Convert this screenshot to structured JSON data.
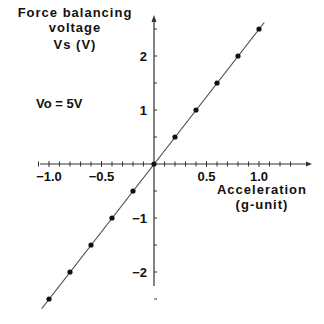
{
  "chart_data": {
    "type": "line",
    "title": "",
    "ylabel": [
      "Force balancing",
      "voltage",
      "Vs (V)"
    ],
    "xlabel": [
      "Acceleration",
      "(g-unit)"
    ],
    "annotation": "Vo = 5V",
    "xlim": [
      -1.15,
      1.35
    ],
    "ylim": [
      -2.6,
      2.8
    ],
    "x_ticks": [
      -1.0,
      -0.5,
      0.5,
      1.0
    ],
    "x_tick_labels": [
      "−1.0",
      "−0.5",
      "0.5",
      "1.0"
    ],
    "y_ticks": [
      -2,
      -1,
      1,
      2
    ],
    "y_tick_labels": [
      "−2",
      "−1",
      "1",
      "2"
    ],
    "grid": false,
    "series": [
      {
        "name": "Vs",
        "x": [
          -1.0,
          -0.8,
          -0.6,
          -0.4,
          -0.2,
          0.0,
          0.2,
          0.4,
          0.6,
          0.8,
          1.0
        ],
        "y": [
          -2.5,
          -2.0,
          -1.5,
          -1.0,
          -0.5,
          0.0,
          0.5,
          1.0,
          1.5,
          2.0,
          2.5
        ]
      }
    ]
  }
}
